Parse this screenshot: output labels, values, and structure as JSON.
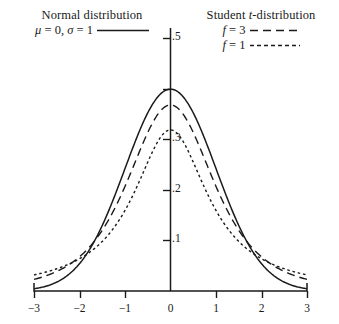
{
  "legend": {
    "normal": {
      "title": "Normal distribution",
      "params_mu": "μ",
      "params_eq1": " = 0, ",
      "params_sigma": "σ",
      "params_eq2": " = 1",
      "line_style": "solid"
    },
    "student": {
      "title_student": "Student ",
      "title_t": "t",
      "title_rest": "-distribution",
      "rows": [
        {
          "symbol": "f",
          "value": " = 3",
          "line_style": "dashed-long"
        },
        {
          "symbol": "f",
          "value": " = 1",
          "line_style": "dashed-short"
        }
      ]
    }
  },
  "axes": {
    "x_tick_labels": [
      "−3",
      "−2",
      "−1",
      "0",
      "1",
      "2",
      "3"
    ],
    "y_tick_labels": [
      ".1",
      ".2",
      ".3",
      ".5"
    ]
  },
  "chart_data": {
    "type": "line",
    "title": "",
    "xlabel": "",
    "ylabel": "",
    "xlim": [
      -3,
      3
    ],
    "ylim": [
      0,
      0.5
    ],
    "grid": false,
    "legend_position": "top",
    "x_ticks": [
      -3,
      -2,
      -1,
      0,
      1,
      2,
      3
    ],
    "y_ticks": [
      0.1,
      0.2,
      0.3,
      0.4,
      0.5
    ],
    "y_ticks_labeled": [
      0.1,
      0.2,
      0.3,
      0.5
    ],
    "x": [
      -3,
      -2.75,
      -2.5,
      -2.25,
      -2,
      -1.75,
      -1.5,
      -1.25,
      -1,
      -0.75,
      -0.5,
      -0.25,
      0,
      0.25,
      0.5,
      0.75,
      1,
      1.25,
      1.5,
      1.75,
      2,
      2.25,
      2.5,
      2.75,
      3
    ],
    "series": [
      {
        "name": "Normal distribution, mu = 0, sigma = 1",
        "style": "solid",
        "peak": 0.399,
        "values": [
          0.0044,
          0.0091,
          0.0175,
          0.0317,
          0.054,
          0.0863,
          0.1295,
          0.1826,
          0.242,
          0.3011,
          0.3521,
          0.3867,
          0.3989,
          0.3867,
          0.3521,
          0.3011,
          0.242,
          0.1826,
          0.1295,
          0.0863,
          0.054,
          0.0317,
          0.0175,
          0.0091,
          0.0044
        ]
      },
      {
        "name": "Student t-distribution, f = 3",
        "style": "dashed-long",
        "peak": 0.3676,
        "values": [
          0.0229,
          0.0293,
          0.0377,
          0.0488,
          0.0675,
          0.0858,
          0.1133,
          0.1496,
          0.1944,
          0.246,
          0.2962,
          0.3392,
          0.3676,
          0.3392,
          0.2962,
          0.246,
          0.1944,
          0.1496,
          0.1133,
          0.0858,
          0.0675,
          0.0488,
          0.0377,
          0.0293,
          0.0229
        ]
      },
      {
        "name": "Student t-distribution, f = 1",
        "style": "dashed-short",
        "peak": 0.3183,
        "values": [
          0.0318,
          0.0376,
          0.0439,
          0.0536,
          0.0637,
          0.0786,
          0.0979,
          0.1232,
          0.1592,
          0.2037,
          0.2546,
          0.2995,
          0.3183,
          0.2995,
          0.2546,
          0.2037,
          0.1592,
          0.1232,
          0.0979,
          0.0786,
          0.0637,
          0.0536,
          0.0439,
          0.0376,
          0.0318
        ]
      }
    ]
  }
}
